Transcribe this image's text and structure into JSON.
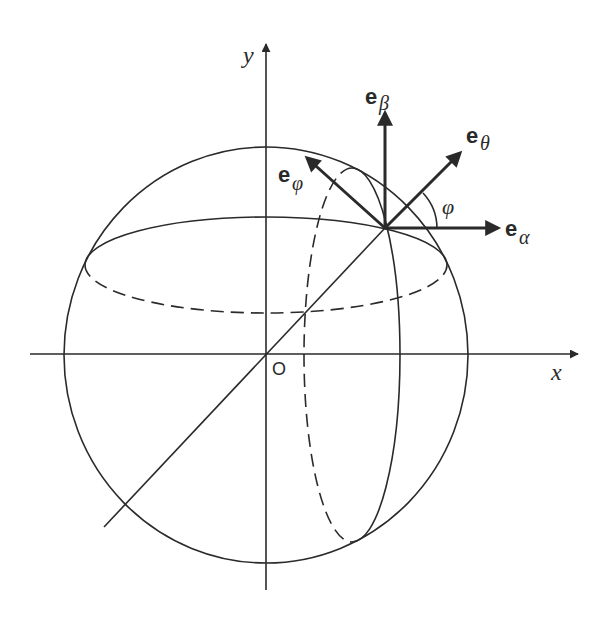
{
  "figure": {
    "colors": {
      "stroke": "#2a2a2a",
      "background": "#ffffff"
    },
    "axes": {
      "x_label": "x",
      "y_label": "y",
      "origin_label": "O"
    },
    "vectors": {
      "alpha": {
        "base": "e",
        "sub": "α"
      },
      "beta": {
        "base": "e",
        "sub": "β"
      },
      "theta": {
        "base": "e",
        "sub": "θ"
      },
      "phi": {
        "base": "e",
        "sub": "φ"
      }
    },
    "angle_label": "φ"
  }
}
